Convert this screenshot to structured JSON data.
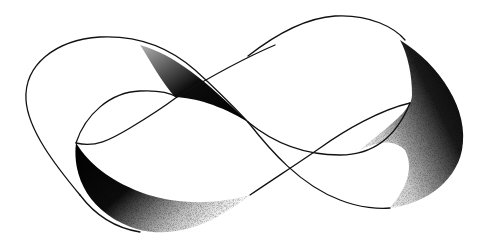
{
  "figure": {
    "background": "#ffffff",
    "ink": "#111111",
    "stipple_style": "dense black stippled shading on inner surfaces"
  }
}
